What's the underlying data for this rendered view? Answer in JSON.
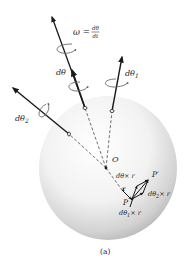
{
  "figure": {
    "caption": "(a)",
    "labels": {
      "omega_lhs": "ω =",
      "omega_num": "dθ",
      "omega_den": "dt",
      "dtheta": "dθ",
      "dtheta1": "dθ",
      "dtheta1_sub": "1",
      "dtheta2": "dθ",
      "dtheta2_sub": "2",
      "origin": "O",
      "point_p": "P",
      "point_p_prime": "P′",
      "r": "r",
      "dtheta_x_r": "dθ× r",
      "dtheta1_x_r": "dθ",
      "dtheta1_x_r_sub": "1",
      "dtheta1_x_r_tail": "× r",
      "dtheta2_x_r": "dθ",
      "dtheta2_x_r_sub": "2",
      "dtheta2_x_r_tail": "× r"
    },
    "colors": {
      "sphere_light": "#ffffff",
      "sphere_dark": "#b8b8b8",
      "arrow": "#1a1a1a",
      "curl": "#666666"
    }
  }
}
